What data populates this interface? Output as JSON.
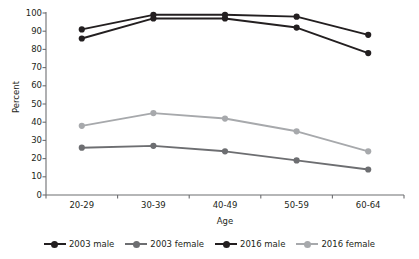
{
  "chart_data": {
    "type": "line",
    "title": "",
    "xlabel": "Age",
    "ylabel": "Percent",
    "categories": [
      "20-29",
      "30-39",
      "40-49",
      "50-59",
      "60-64"
    ],
    "ylim": [
      0,
      100
    ],
    "yticks": [
      0,
      10,
      20,
      30,
      40,
      50,
      60,
      70,
      80,
      90,
      100
    ],
    "grid": false,
    "legend_position": "bottom",
    "markers": "circle",
    "series": [
      {
        "name": "2003 male",
        "color": "#231f20",
        "values": [
          86,
          97,
          97,
          92,
          78
        ]
      },
      {
        "name": "2003 female",
        "color": "#6d6e71",
        "values": [
          26,
          27,
          24,
          19,
          14
        ]
      },
      {
        "name": "2016 male",
        "color": "#231f20",
        "values": [
          91,
          99,
          99,
          98,
          88
        ]
      },
      {
        "name": "2016 female",
        "color": "#a7a9ac",
        "values": [
          38,
          45,
          42,
          35,
          24
        ]
      }
    ]
  },
  "axis": {
    "ylabel": "Percent",
    "xlabel": "Age"
  }
}
